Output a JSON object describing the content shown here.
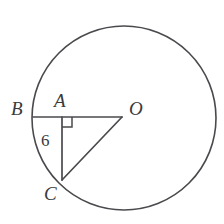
{
  "figure": {
    "kind": "circle-with-inscribed-right-triangle",
    "background_color": "#ffffff",
    "stroke_color": "#4a4a4e",
    "label_color": "#3a3a3c",
    "circle": {
      "name": "main-circle",
      "center_x": 124,
      "center_y": 118,
      "radius": 92,
      "stroke_width": 1.6
    },
    "points": [
      {
        "id": "B",
        "label": "B",
        "x": 33,
        "y": 117,
        "on_circle": true
      },
      {
        "id": "A",
        "label": "A",
        "x": 62,
        "y": 117,
        "on_circle": false
      },
      {
        "id": "O",
        "label": "O",
        "x": 122,
        "y": 117,
        "on_circle": false,
        "is_center": true
      },
      {
        "id": "C",
        "label": "C",
        "x": 62,
        "y": 180,
        "on_circle": true
      }
    ],
    "segments": [
      {
        "id": "BO",
        "from": "B",
        "to": "O",
        "x1": 33,
        "y1": 117,
        "x2": 122,
        "y2": 117
      },
      {
        "id": "AC",
        "from": "A",
        "to": "C",
        "x1": 62,
        "y1": 117,
        "x2": 62,
        "y2": 180
      },
      {
        "id": "OC",
        "from": "O",
        "to": "C",
        "x1": 122,
        "y1": 117,
        "x2": 62,
        "y2": 180
      }
    ],
    "right_angle": {
      "id": "right-angle-at-A",
      "at_point": "A",
      "x": 62,
      "y": 117,
      "size": 10
    },
    "labels": {
      "B": "B",
      "A": "A",
      "O": "O",
      "C": "C",
      "segment_AC_length": "6"
    }
  }
}
